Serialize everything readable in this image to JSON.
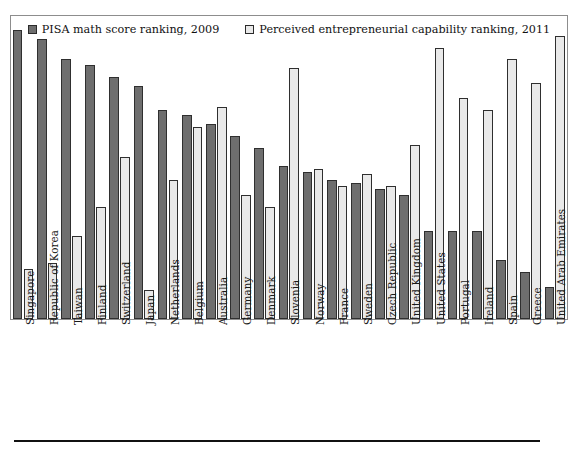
{
  "legend": {
    "items": [
      {
        "label": "PISA math score ranking, 2009",
        "icon": "square-swatch-dark",
        "color": "#6e6e6e"
      },
      {
        "label": "Perceived entrepreneurial capability ranking, 2011",
        "icon": "square-swatch-light",
        "color": "#e9e9e9"
      }
    ]
  },
  "chart_data": {
    "type": "bar",
    "title": "",
    "subtitle": "",
    "xlabel": "",
    "ylabel": "",
    "ylim": [
      0,
      100
    ],
    "grid": false,
    "legend_position": "top-center",
    "categories": [
      "Singapore",
      "Republic of Korea",
      "Taiwan",
      "Finland",
      "Switzerland",
      "Japan",
      "Netherlands",
      "Belgium",
      "Australia",
      "Germany",
      "Denmark",
      "Slovenia",
      "Norway",
      "France",
      "Sweden",
      "Czech Republic",
      "United Kingdom",
      "United States",
      "Portugal",
      "Ireland",
      "Spain",
      "Greece",
      "United Arab Emirates"
    ],
    "series": [
      {
        "name": "PISA math score ranking, 2009",
        "color": "#6e6e6e",
        "values": [
          98,
          95,
          88,
          86,
          82,
          79,
          71,
          69,
          66,
          62,
          58,
          52,
          50,
          47,
          46,
          44,
          42,
          30,
          30,
          30,
          20,
          16,
          11
        ]
      },
      {
        "name": "Perceived entrepreneurial capability ranking, 2011",
        "color": "#e9e9e9",
        "values": [
          17,
          19,
          28,
          38,
          55,
          10,
          47,
          65,
          72,
          42,
          38,
          85,
          51,
          45,
          49,
          45,
          59,
          92,
          75,
          71,
          88,
          80,
          96
        ]
      }
    ]
  }
}
